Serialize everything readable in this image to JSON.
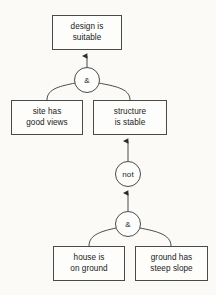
{
  "diagram": {
    "background_color": "#fbfaf7",
    "stroke_color": "#4a4a4a",
    "text_color": "#1a1a1a",
    "nodes": [
      {
        "id": "design-is-suitable",
        "line1": "design is",
        "line2": "suitable",
        "x": 52,
        "y": 15,
        "w": 70,
        "h": 35
      },
      {
        "id": "site-has-good-views",
        "line1": "site has",
        "line2": "good views",
        "x": 11,
        "y": 100,
        "w": 72,
        "h": 35
      },
      {
        "id": "structure-is-stable",
        "line1": "structure",
        "line2": "is stable",
        "x": 93,
        "y": 100,
        "w": 74,
        "h": 35
      },
      {
        "id": "house-is-on-ground",
        "line1": "house is",
        "line2": "on ground",
        "x": 53,
        "y": 246,
        "w": 72,
        "h": 35
      },
      {
        "id": "ground-has-steep-slope",
        "line1": "ground has",
        "line2": "steep slope",
        "x": 135,
        "y": 246,
        "w": 73,
        "h": 35
      }
    ],
    "gates": [
      {
        "id": "and-gate-top",
        "label": "&",
        "cx": 87,
        "cy": 80,
        "r": 13
      },
      {
        "id": "not-gate",
        "label": "not",
        "cx": 128,
        "cy": 174,
        "r": 13
      },
      {
        "id": "and-gate-bottom",
        "label": "&",
        "cx": 128,
        "cy": 224,
        "r": 13
      }
    ],
    "connections": [
      {
        "id": "and-top-to-design",
        "from": "and-gate-top",
        "to": "design-is-suitable",
        "kind": "arrow"
      },
      {
        "id": "site-to-and-top",
        "from": "site-has-good-views",
        "to": "and-gate-top",
        "kind": "curve"
      },
      {
        "id": "structure-to-and-top",
        "from": "structure-is-stable",
        "to": "and-gate-top",
        "kind": "curve"
      },
      {
        "id": "not-to-structure",
        "from": "not-gate",
        "to": "structure-is-stable",
        "kind": "arrow"
      },
      {
        "id": "and-bottom-to-not",
        "from": "and-gate-bottom",
        "to": "not-gate",
        "kind": "arrow"
      },
      {
        "id": "house-to-and-bottom",
        "from": "house-is-on-ground",
        "to": "and-gate-bottom",
        "kind": "curve"
      },
      {
        "id": "ground-to-and-bottom",
        "from": "ground-has-steep-slope",
        "to": "and-gate-bottom",
        "kind": "curve"
      }
    ]
  }
}
